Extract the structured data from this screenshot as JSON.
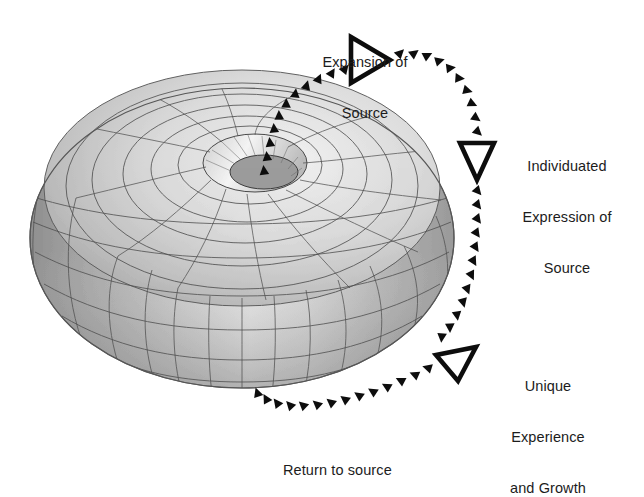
{
  "diagram": {
    "background_color": "#ffffff",
    "torus": {
      "name": "torus",
      "fill_light": "#e6e6e6",
      "fill_mid": "#c2c2c2",
      "fill_dark": "#8d8d8d",
      "grid_color": "#4a4a4a",
      "outline_color": "#555555",
      "center_x": 242,
      "center_y": 238,
      "outer_radius_x": 212,
      "outer_radius_y": 150,
      "hole_radius_x": 46,
      "hole_radius_y": 26,
      "meridian_count": 24,
      "ring_count": 7
    },
    "arrows": {
      "color": "#111111",
      "marker_color": "#000000",
      "flow_name": "toroidal-flow",
      "segments": [
        {
          "name": "rise-from-center",
          "direction": "up-right"
        },
        {
          "name": "expansion-arc",
          "direction": "right-down"
        },
        {
          "name": "descent-arc",
          "direction": "down"
        },
        {
          "name": "return-arc",
          "direction": "left"
        }
      ]
    },
    "labels": [
      {
        "id": "expansion-of-source",
        "line1": "Expansion of",
        "line2": "Source",
        "x": 360,
        "y": 22,
        "align": "center"
      },
      {
        "id": "individuated-expression-of-source",
        "line1": "Individuated",
        "line2": "Expression of",
        "line3": "Source",
        "x": 519,
        "y": 127,
        "align": "center"
      },
      {
        "id": "unique-experience-and-growth",
        "line1": "Unique",
        "line2": "Experience",
        "line3": "and Growth",
        "x": 504,
        "y": 347,
        "align": "center"
      },
      {
        "id": "return-to-source",
        "line1": "Return to source",
        "x": 283,
        "y": 433,
        "align": "left"
      }
    ],
    "markers": [
      {
        "id": "marker-expansion",
        "shape": "hollow-triangle",
        "points_to": "right"
      },
      {
        "id": "marker-individuated",
        "shape": "hollow-triangle",
        "points_to": "down"
      },
      {
        "id": "marker-unique",
        "shape": "hollow-triangle",
        "points_to": "down-left"
      }
    ]
  }
}
